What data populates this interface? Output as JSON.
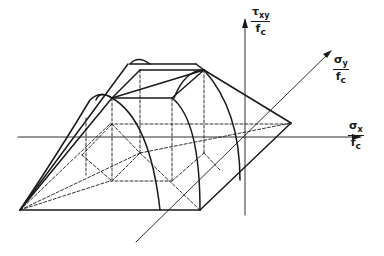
{
  "diagram": {
    "axes": {
      "tau": {
        "symbol": "τ",
        "sub": "xy",
        "denominator": "f",
        "den_sub": "c"
      },
      "sigma_y": {
        "symbol": "σ",
        "sub": "y",
        "denominator": "f",
        "den_sub": "c"
      },
      "sigma_x": {
        "symbol": "σ",
        "sub": "x",
        "denominator": "f",
        "den_sub": "c"
      }
    },
    "colors": {
      "line": "#1a1a1a",
      "background": "#ffffff"
    }
  }
}
